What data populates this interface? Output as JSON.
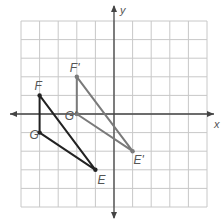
{
  "diagram": {
    "type": "coordinate-grid-translation",
    "grid": {
      "x_min": -5,
      "x_max": 5,
      "y_min": -5,
      "y_max": 5,
      "cell_px": 18.6,
      "origin_px": [
        114,
        114
      ]
    },
    "axes": {
      "x_label": "x",
      "y_label": "y"
    },
    "colors": {
      "grid": "#c8c8c8",
      "axis": "#444444",
      "original": "#222222",
      "image": "#7a7a7a",
      "label": "#555555"
    },
    "original_triangle": {
      "name": "EFG",
      "points": [
        {
          "label": "F",
          "x": -4,
          "y": 1
        },
        {
          "label": "G",
          "x": -4,
          "y": -1
        },
        {
          "label": "E",
          "x": -1,
          "y": -3
        }
      ]
    },
    "image_triangle": {
      "name": "E'F'G'",
      "points": [
        {
          "label": "F'",
          "x": -2,
          "y": 2
        },
        {
          "label": "G'",
          "x": -2,
          "y": 0
        },
        {
          "label": "E'",
          "x": 1,
          "y": -2
        }
      ]
    }
  }
}
